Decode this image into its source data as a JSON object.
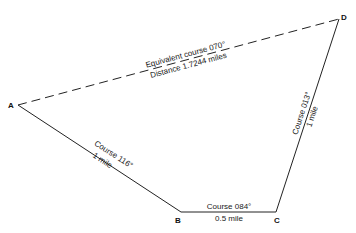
{
  "diagram": {
    "type": "course-plot",
    "colors": {
      "line": "#222222",
      "text": "#1a1a1a",
      "background": "#ffffff"
    },
    "points": [
      {
        "id": "A",
        "label": "A",
        "x": 18,
        "y": 105
      },
      {
        "id": "B",
        "label": "B",
        "x": 181,
        "y": 212
      },
      {
        "id": "C",
        "label": "C",
        "x": 276,
        "y": 212
      },
      {
        "id": "D",
        "label": "D",
        "x": 339,
        "y": 19
      }
    ],
    "legs": [
      {
        "from": "A",
        "to": "B",
        "course": "Course 116°",
        "distance": "1 mile",
        "style": "solid"
      },
      {
        "from": "B",
        "to": "C",
        "course": "Course 084°",
        "distance": "0.5 mile",
        "style": "solid"
      },
      {
        "from": "C",
        "to": "D",
        "course": "Course 013°",
        "distance": "1 mile",
        "style": "solid"
      },
      {
        "from": "A",
        "to": "D",
        "course": "Equivalent course 070°",
        "distance": "Distance 1.7244 miles",
        "style": "dashed"
      }
    ]
  }
}
